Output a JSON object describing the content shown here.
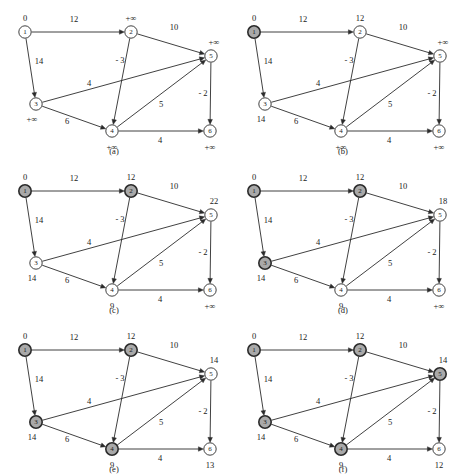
{
  "figure": {
    "width": 458,
    "height": 476,
    "colors": {
      "stroke": "#2b2b2b",
      "node_open_fill": "#ffffff",
      "node_closed_fill": "#a9a9a9",
      "background": "#ffffff",
      "text": "#1a1a1a"
    }
  },
  "graph": {
    "node_ids": [
      "1",
      "2",
      "3",
      "4",
      "5",
      "6"
    ],
    "node_positions": {
      "1": {
        "x": 25,
        "y": 32
      },
      "2": {
        "x": 131,
        "y": 32
      },
      "3": {
        "x": 36,
        "y": 104
      },
      "4": {
        "x": 112,
        "y": 131
      },
      "5": {
        "x": 211,
        "y": 56
      },
      "6": {
        "x": 210,
        "y": 131
      }
    },
    "edges": [
      {
        "id": "e1-2",
        "from": "1",
        "to": "2",
        "weight": "12",
        "label_x": 74,
        "label_y": 22
      },
      {
        "id": "e1-3",
        "from": "1",
        "to": "3",
        "weight": "14",
        "label_x": 39,
        "label_y": 64
      },
      {
        "id": "e2-5",
        "from": "2",
        "to": "5",
        "weight": "10",
        "label_x": 174,
        "label_y": 30
      },
      {
        "id": "e2-4",
        "from": "2",
        "to": "4",
        "weight": "- 3",
        "label_x": 120,
        "label_y": 63
      },
      {
        "id": "e3-5",
        "from": "3",
        "to": "5",
        "weight": "4",
        "label_x": 89,
        "label_y": 86
      },
      {
        "id": "e3-4",
        "from": "3",
        "to": "4",
        "weight": "6",
        "label_x": 67,
        "label_y": 124
      },
      {
        "id": "e4-5",
        "from": "4",
        "to": "5",
        "weight": "5",
        "label_x": 161,
        "label_y": 107
      },
      {
        "id": "e4-6",
        "from": "4",
        "to": "6",
        "weight": "4",
        "label_x": 160,
        "label_y": 143
      },
      {
        "id": "e5-6",
        "from": "5",
        "to": "6",
        "weight": "- 2",
        "label_x": 203,
        "label_y": 96
      }
    ],
    "dist_label_offsets": {
      "1": {
        "dx": 0,
        "dy": -11
      },
      "2": {
        "dx": 0,
        "dy": -11
      },
      "3": {
        "dx": -4,
        "dy": 18
      },
      "4": {
        "dx": 0,
        "dy": 19
      },
      "5": {
        "dx": 3,
        "dy": -11
      },
      "6": {
        "dx": 0,
        "dy": 19
      }
    }
  },
  "panels": [
    {
      "key": "a",
      "caption": "(a)",
      "caption_x": 114,
      "caption_y": 154,
      "origin": {
        "left": 0,
        "top": 0
      },
      "distances": {
        "1": "0",
        "2": "+∞",
        "3": "+∞",
        "4": "+∞",
        "5": "+∞",
        "6": "+∞"
      },
      "closed": []
    },
    {
      "key": "b",
      "caption": "(b)",
      "caption_x": 114,
      "caption_y": 154,
      "origin": {
        "left": 229,
        "top": 0
      },
      "distances": {
        "1": "0",
        "2": "12",
        "3": "14",
        "4": "+∞",
        "5": "+∞",
        "6": "+∞"
      },
      "closed": [
        "1"
      ]
    },
    {
      "key": "c",
      "caption": "(c)",
      "caption_x": 114,
      "caption_y": 154,
      "origin": {
        "left": 0,
        "top": 159
      },
      "distances": {
        "1": "0",
        "2": "12",
        "3": "14",
        "4": "9",
        "5": "22",
        "6": "+∞"
      },
      "closed": [
        "1",
        "2"
      ]
    },
    {
      "key": "d",
      "caption": "(d)",
      "caption_x": 114,
      "caption_y": 154,
      "origin": {
        "left": 229,
        "top": 159
      },
      "distances": {
        "1": "0",
        "2": "12",
        "3": "14",
        "4": "9",
        "5": "18",
        "6": "+∞"
      },
      "closed": [
        "1",
        "2",
        "3"
      ]
    },
    {
      "key": "e",
      "caption": "(e)",
      "caption_x": 114,
      "caption_y": 154,
      "origin": {
        "left": 0,
        "top": 318
      },
      "distances": {
        "1": "0",
        "2": "12",
        "3": "14",
        "4": "9",
        "5": "14",
        "6": "13"
      },
      "closed": [
        "1",
        "2",
        "3",
        "4"
      ]
    },
    {
      "key": "f",
      "caption": "(f)",
      "caption_x": 114,
      "caption_y": 154,
      "origin": {
        "left": 229,
        "top": 318
      },
      "distances": {
        "1": "0",
        "2": "12",
        "3": "14",
        "4": "9",
        "5": "14",
        "6": "12"
      },
      "closed": [
        "1",
        "2",
        "3",
        "4",
        "5"
      ]
    }
  ]
}
